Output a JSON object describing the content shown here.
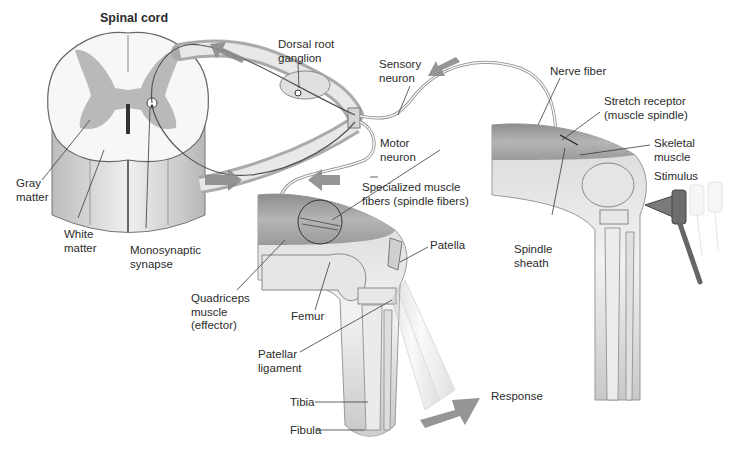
{
  "figure": {
    "colors": {
      "background": "#ffffff",
      "gray_matter": "#b9b9b9",
      "white_matter": "#f4f4f4",
      "arrow": "#8a8a8a",
      "outline": "#555555",
      "label_text": "#2b2b2b",
      "leader_line": "#3a3a3a"
    }
  },
  "labels": {
    "spinal_cord": "Spinal cord",
    "dorsal_root_ganglion": [
      "Dorsal root",
      "ganglion"
    ],
    "sensory_neuron": [
      "Sensory",
      "neuron"
    ],
    "nerve_fiber": "Nerve fiber",
    "stretch_receptor": [
      "Stretch receptor",
      "(muscle spindle)"
    ],
    "skeletal_muscle": [
      "Skeletal",
      "muscle"
    ],
    "stimulus": "Stimulus",
    "motor_neuron": [
      "Motor",
      "neuron"
    ],
    "specialized_fibers": [
      "Specialized muscle",
      "fibers (spindle fibers)"
    ],
    "gray_matter": [
      "Gray",
      "matter"
    ],
    "white_matter": [
      "White",
      "matter"
    ],
    "monosynaptic_synapse": [
      "Monosynaptic",
      "synapse"
    ],
    "spindle_sheath": [
      "Spindle",
      "sheath"
    ],
    "patella": "Patella",
    "quadriceps": [
      "Quadriceps",
      "muscle",
      "(effector)"
    ],
    "femur": "Femur",
    "patellar_ligament": [
      "Patellar",
      "ligament"
    ],
    "tibia": "Tibia",
    "fibula": "Fibula",
    "response": "Response"
  }
}
